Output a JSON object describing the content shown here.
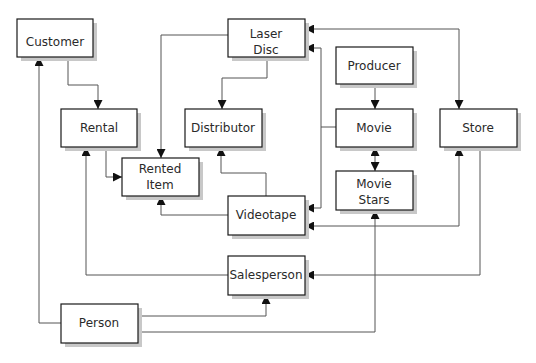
{
  "diagram": {
    "type": "entity-relationship",
    "colors": {
      "stroke": "#1a1a1a",
      "line": "#555555",
      "shadow": "#c8c8c8",
      "fill": "#ffffff",
      "text": "#2a2a2a"
    },
    "entities": {
      "customer": {
        "label": [
          "Customer"
        ]
      },
      "laser_disc": {
        "label": [
          "Laser",
          "Disc"
        ]
      },
      "producer": {
        "label": [
          "Producer"
        ]
      },
      "rental": {
        "label": [
          "Rental"
        ]
      },
      "distributor": {
        "label": [
          "Distributor"
        ]
      },
      "movie": {
        "label": [
          "Movie"
        ]
      },
      "store": {
        "label": [
          "Store"
        ]
      },
      "rented_item": {
        "label": [
          "Rented",
          "Item"
        ]
      },
      "movie_stars": {
        "label": [
          "Movie",
          "Stars"
        ]
      },
      "videotape": {
        "label": [
          "Videotape"
        ]
      },
      "salesperson": {
        "label": [
          "Salesperson"
        ]
      },
      "person": {
        "label": [
          "Person"
        ]
      }
    },
    "relationships": [
      {
        "from": "Customer",
        "to": "Rental"
      },
      {
        "from": "Laser Disc",
        "to": "Rented Item"
      },
      {
        "from": "Laser Disc",
        "to": "Distributor"
      },
      {
        "from": "Store",
        "to": "Laser Disc",
        "bidirectional": true
      },
      {
        "from": "Movie",
        "to": "Laser Disc"
      },
      {
        "from": "Movie",
        "to": "Videotape"
      },
      {
        "from": "Producer",
        "to": "Movie"
      },
      {
        "from": "Movie",
        "to": "Movie Stars",
        "bidirectional": true
      },
      {
        "from": "Rental",
        "to": "Rented Item"
      },
      {
        "from": "Videotape",
        "to": "Distributor"
      },
      {
        "from": "Videotape",
        "to": "Rented Item"
      },
      {
        "from": "Store",
        "to": "Videotape"
      },
      {
        "from": "Store",
        "to": "Salesperson"
      },
      {
        "from": "Salesperson",
        "to": "Rental"
      },
      {
        "from": "Person",
        "to": "Customer"
      },
      {
        "from": "Person",
        "to": "Salesperson"
      },
      {
        "from": "Person",
        "to": "Movie Stars"
      }
    ]
  }
}
